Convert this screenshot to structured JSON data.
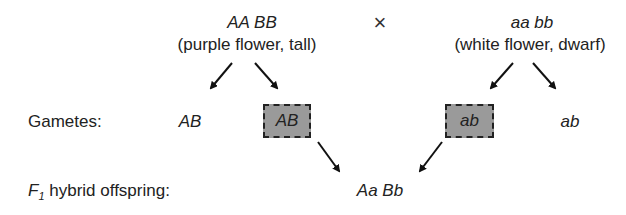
{
  "parent1": {
    "genotype": "AA BB",
    "phenotype": "(purple flower, tall)"
  },
  "cross_symbol": "×",
  "parent2": {
    "genotype": "aa bb",
    "phenotype": "(white flower, dwarf)"
  },
  "gametes": {
    "label": "Gametes:",
    "parent1": [
      "AB",
      "AB"
    ],
    "parent2": [
      "ab",
      "ab"
    ]
  },
  "f1": {
    "label_prefix": "F",
    "label_sub": "1",
    "label_suffix": " hybrid offspring:",
    "genotype": "Aa Bb"
  },
  "colors": {
    "box_fill": "#9a9a9a",
    "box_border": "#222222",
    "text": "#222222"
  }
}
